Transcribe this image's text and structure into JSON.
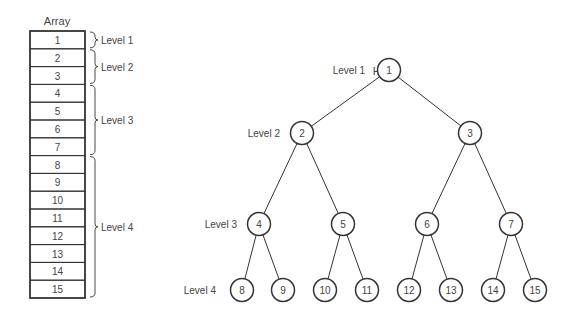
{
  "array": {
    "title": "Array",
    "cells": [
      "1",
      "2",
      "3",
      "4",
      "5",
      "6",
      "7",
      "8",
      "9",
      "10",
      "11",
      "12",
      "13",
      "14",
      "15"
    ],
    "levels": [
      {
        "label": "Level 1",
        "from": 0,
        "to": 0
      },
      {
        "label": "Level 2",
        "from": 1,
        "to": 2
      },
      {
        "label": "Level 3",
        "from": 3,
        "to": 6
      },
      {
        "label": "Level 4",
        "from": 7,
        "to": 14
      }
    ]
  },
  "heap": {
    "title": "Heap",
    "level_labels": [
      "Level 1",
      "Level 2",
      "Level 3",
      "Level 4"
    ],
    "nodes": [
      "1",
      "2",
      "3",
      "4",
      "5",
      "6",
      "7",
      "8",
      "9",
      "10",
      "11",
      "12",
      "13",
      "14",
      "15"
    ]
  },
  "colors": {
    "stroke": "#333333",
    "text": "#444444",
    "background": "#ffffff"
  }
}
